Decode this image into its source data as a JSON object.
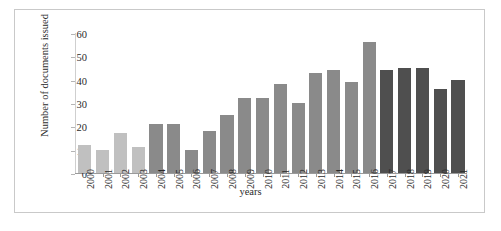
{
  "chart_data": {
    "type": "bar",
    "title": "",
    "xlabel": "years",
    "ylabel": "Number of documents issued",
    "categories": [
      "2000",
      "2001",
      "2002",
      "2003",
      "2004",
      "2005",
      "2006",
      "2007",
      "2008",
      "2009",
      "2010",
      "2011",
      "2012",
      "2013",
      "2014",
      "2015",
      "2016",
      "2017",
      "2018",
      "2019",
      "2020",
      "2021"
    ],
    "values": [
      12,
      10,
      17,
      11,
      21,
      21,
      10,
      18,
      25,
      32,
      32,
      38,
      30,
      43,
      44,
      39,
      56,
      44,
      45,
      45,
      36,
      40
    ],
    "ylim": [
      0,
      60
    ],
    "yticks": [
      0,
      10,
      20,
      30,
      40,
      50,
      60
    ],
    "ytick_labels": [
      "0",
      "10",
      "20",
      "30",
      "40",
      "50",
      "60"
    ],
    "grid": false,
    "legend": "none",
    "bar_colors": [
      "#c0c0c0",
      "#c0c0c0",
      "#c0c0c0",
      "#c0c0c0",
      "#8a8a8a",
      "#8a8a8a",
      "#8a8a8a",
      "#8a8a8a",
      "#8a8a8a",
      "#8a8a8a",
      "#8a8a8a",
      "#8a8a8a",
      "#8a8a8a",
      "#8a8a8a",
      "#8a8a8a",
      "#8a8a8a",
      "#8a8a8a",
      "#4f4f4f",
      "#4f4f4f",
      "#4f4f4f",
      "#4f4f4f",
      "#4f4f4f"
    ]
  },
  "figure": {
    "border_color": "#c9c9c9",
    "background": "#ffffff"
  }
}
